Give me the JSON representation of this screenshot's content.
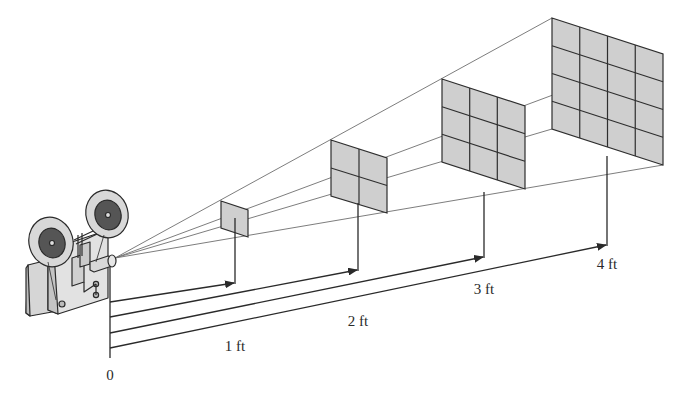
{
  "figure": {
    "colors": {
      "background": "#ffffff",
      "line": "#3a3a3a",
      "ray": "#6a6a6a",
      "screen_fill": "#cfcfcf",
      "screen_grid": "#2e2e2e",
      "projector_fill": "#d9d9d9",
      "reel_dark": "#555555"
    },
    "origin_label": "0",
    "distance_labels": [
      {
        "text": "1 ft",
        "x": 235,
        "y": 346
      },
      {
        "text": "2 ft",
        "x": 358,
        "y": 321
      },
      {
        "text": "3 ft",
        "x": 484,
        "y": 289
      },
      {
        "text": "4 ft",
        "x": 607,
        "y": 264
      }
    ],
    "screens": [
      {
        "distance_ft": 1,
        "grid": 1
      },
      {
        "distance_ft": 2,
        "grid": 2
      },
      {
        "distance_ft": 3,
        "grid": 3
      },
      {
        "distance_ft": 4,
        "grid": 4
      }
    ]
  }
}
